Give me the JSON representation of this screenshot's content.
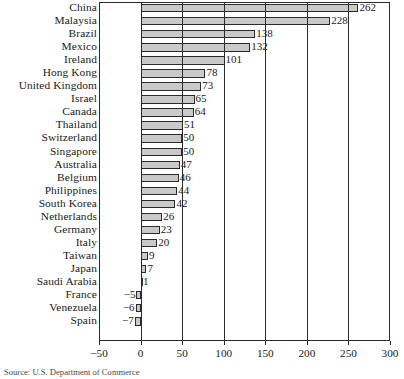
{
  "chart_data": {
    "type": "bar",
    "orientation": "horizontal",
    "title": "",
    "xlabel": "",
    "ylabel": "",
    "xlim": [
      -50,
      300
    ],
    "xticks": [
      -50,
      0,
      50,
      100,
      150,
      200,
      250,
      300
    ],
    "xtick_labels": [
      "−50",
      "0",
      "50",
      "100",
      "150",
      "200",
      "250",
      "300"
    ],
    "grid": true,
    "grid_axis": "x",
    "legend": false,
    "bar_fill_color": "#c9c9c9",
    "bar_edge_color": "#2b2b2b",
    "show_value_labels": true,
    "categories": [
      "China",
      "Malaysia",
      "Brazil",
      "Mexico",
      "Ireland",
      "Hong Kong",
      "United Kingdom",
      "Israel",
      "Canada",
      "Thailand",
      "Switzerland",
      "Singapore",
      "Australia",
      "Belgium",
      "Philippines",
      "South Korea",
      "Netherlands",
      "Germany",
      "Italy",
      "Taiwan",
      "Japan",
      "Saudi Arabia",
      "France",
      "Venezuela",
      "Spain"
    ],
    "values": [
      262,
      228,
      138,
      132,
      101,
      78,
      73,
      65,
      64,
      51,
      50,
      50,
      47,
      46,
      44,
      42,
      26,
      23,
      20,
      9,
      7,
      1,
      -5,
      -6,
      -7
    ],
    "value_labels": [
      "262",
      "228",
      "138",
      "132",
      "101",
      "78",
      "73",
      "65",
      "64",
      "51",
      "50",
      "50",
      "47",
      "46",
      "44",
      "42",
      "26",
      "23",
      "20",
      "9",
      "7",
      "1",
      "−5",
      "−6",
      "−7"
    ]
  },
  "source": {
    "note": "Source: U.S. Department of Commerce"
  }
}
